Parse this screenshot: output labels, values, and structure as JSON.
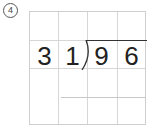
{
  "problem": {
    "number_label": "4",
    "number_display": "④"
  },
  "division": {
    "divisor": [
      "3",
      "1"
    ],
    "dividend": [
      "9",
      "6"
    ],
    "divisor_value": "31",
    "dividend_value": "96"
  },
  "grid": {
    "rows": 4,
    "cols": 4
  }
}
